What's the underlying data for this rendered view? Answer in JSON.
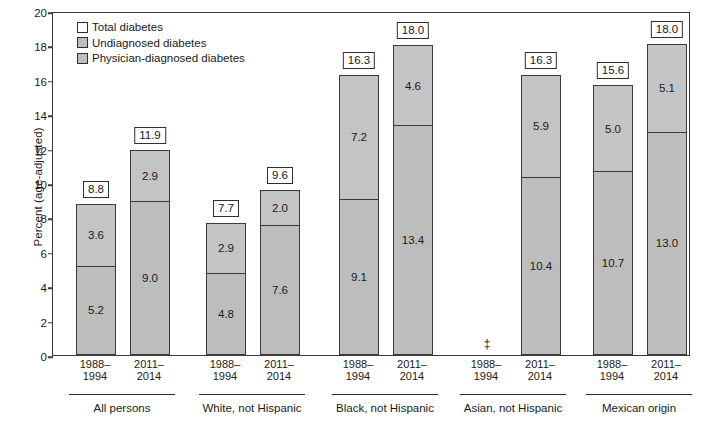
{
  "chart_data": {
    "type": "bar",
    "title": "",
    "xlabel": "",
    "ylabel": "Percent (age-adjusted)",
    "ylim": [
      0,
      20
    ],
    "ytick_step": 2,
    "ytick_labels": [
      "0",
      "2",
      "4",
      "6",
      "8",
      "10",
      "12",
      "14",
      "16",
      "18",
      "20"
    ],
    "grid": false,
    "stacked": true,
    "legend_position": "top-left",
    "legend": [
      {
        "label": "Total diabetes",
        "color": "#ffffff",
        "swatch": "outline"
      },
      {
        "label": "Undiagnosed diabetes",
        "color": "#c4c4c4",
        "swatch": "filled"
      },
      {
        "label": "Physician-diagnosed diabetes",
        "color": "#bdbdbd",
        "swatch": "filled"
      }
    ],
    "series": [
      {
        "name": "Physician-diagnosed diabetes",
        "values": [
          5.2,
          9.0,
          4.8,
          7.6,
          9.1,
          13.4,
          null,
          10.4,
          10.7,
          13.0
        ]
      },
      {
        "name": "Undiagnosed diabetes",
        "values": [
          3.6,
          2.9,
          2.9,
          2.0,
          7.2,
          4.6,
          null,
          5.9,
          5.0,
          5.1
        ]
      }
    ],
    "totals": [
      8.8,
      11.9,
      7.7,
      9.6,
      16.3,
      18.0,
      null,
      16.3,
      15.6,
      18.0
    ],
    "categories": [
      "1988–1994",
      "2011–2014",
      "1988–1994",
      "2011–2014",
      "1988–1994",
      "2011–2014",
      "1988–1994",
      "2011–2014",
      "1988–1994",
      "2011–2014"
    ],
    "group_labels": [
      "All persons",
      "White, not Hispanic",
      "Black, not Hispanic",
      "Asian, not Hispanic",
      "Mexican origin"
    ],
    "suppressed_marker": "‡",
    "bars": [
      {
        "group": "All persons",
        "period": "1988–1994",
        "dx": 5.2,
        "undx": 3.6,
        "total": 8.8
      },
      {
        "group": "All persons",
        "period": "2011–2014",
        "dx": 9.0,
        "undx": 2.9,
        "total": 11.9
      },
      {
        "group": "White, not Hispanic",
        "period": "1988–1994",
        "dx": 4.8,
        "undx": 2.9,
        "total": 7.7
      },
      {
        "group": "White, not Hispanic",
        "period": "2011–2014",
        "dx": 7.6,
        "undx": 2.0,
        "total": 9.6
      },
      {
        "group": "Black, not Hispanic",
        "period": "1988–1994",
        "dx": 9.1,
        "undx": 7.2,
        "total": 16.3
      },
      {
        "group": "Black, not Hispanic",
        "period": "2011–2014",
        "dx": 13.4,
        "undx": 4.6,
        "total": 18.0
      },
      {
        "group": "Asian, not Hispanic",
        "period": "1988–1994",
        "dx": null,
        "undx": null,
        "total": null,
        "suppressed": true
      },
      {
        "group": "Asian, not Hispanic",
        "period": "2011–2014",
        "dx": 10.4,
        "undx": 5.9,
        "total": 16.3
      },
      {
        "group": "Mexican origin",
        "period": "1988–1994",
        "dx": 10.7,
        "undx": 5.0,
        "total": 15.6
      },
      {
        "group": "Mexican origin",
        "period": "2011–2014",
        "dx": 13.0,
        "undx": 5.1,
        "total": 18.0
      }
    ]
  },
  "labels": {
    "dx_values": [
      "5.2",
      "9.0",
      "4.8",
      "7.6",
      "9.1",
      "13.4",
      "",
      "10.4",
      "10.7",
      "13.0"
    ],
    "undx_values": [
      "3.6",
      "2.9",
      "2.9",
      "2.0",
      "7.2",
      "4.6",
      "",
      "5.9",
      "5.0",
      "5.1"
    ],
    "total_values": [
      "8.8",
      "11.9",
      "7.7",
      "9.6",
      "16.3",
      "18.0",
      "",
      "16.3",
      "15.6",
      "18.0"
    ]
  },
  "colors": {
    "frame": "#3a3a3a",
    "undiagnosed": "#c4c4c4",
    "diagnosed": "#bdbdbd",
    "total_box": "#ffffff",
    "text": "#1a1a1a"
  }
}
